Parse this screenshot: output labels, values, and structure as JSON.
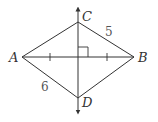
{
  "diagram": {
    "type": "rhombus-perpendicular-bisector",
    "points": {
      "A": {
        "label": "A",
        "x": 22,
        "y": 57
      },
      "B": {
        "label": "B",
        "x": 134,
        "y": 57
      },
      "C": {
        "label": "C",
        "x": 78,
        "y": 22
      },
      "D": {
        "label": "D",
        "x": 78,
        "y": 98
      }
    },
    "segment_labels": {
      "CB": "5",
      "AD": "6"
    },
    "stroke_color": "#333333"
  }
}
